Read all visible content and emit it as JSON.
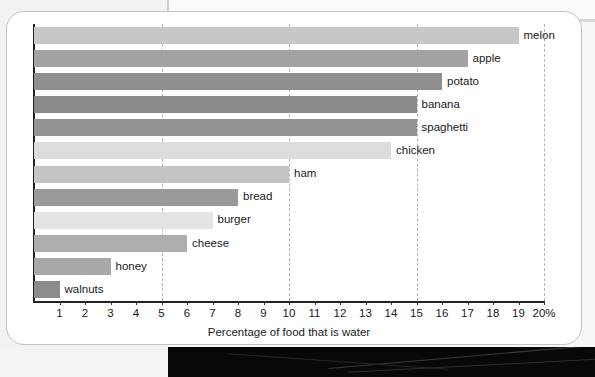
{
  "chart_data": {
    "type": "bar",
    "orientation": "horizontal",
    "title": "",
    "xlabel": "Percentage of food that is water",
    "ylabel": "",
    "xlim": [
      0,
      20
    ],
    "grid": true,
    "grid_values": [
      5,
      10,
      15,
      20
    ],
    "axis_unit_suffix": "%",
    "legend": "none",
    "tick_labels": [
      "1",
      "2",
      "3",
      "4",
      "5",
      "6",
      "7",
      "8",
      "9",
      "10",
      "11",
      "12",
      "13",
      "14",
      "15",
      "16",
      "17",
      "18",
      "19",
      "20%"
    ],
    "tick_values": [
      1,
      2,
      3,
      4,
      5,
      6,
      7,
      8,
      9,
      10,
      11,
      12,
      13,
      14,
      15,
      16,
      17,
      18,
      19,
      20
    ],
    "categories": [
      "melon",
      "apple",
      "potato",
      "banana",
      "spaghetti",
      "chicken",
      "ham",
      "bread",
      "burger",
      "cheese",
      "honey",
      "walnuts"
    ],
    "values": [
      19,
      17,
      16,
      15,
      15,
      14,
      10,
      8,
      7,
      6,
      3,
      1
    ],
    "bars": [
      {
        "label": "melon",
        "value": 19,
        "color": "#c7c7c7"
      },
      {
        "label": "apple",
        "value": 17,
        "color": "#a3a3a3"
      },
      {
        "label": "potato",
        "value": 16,
        "color": "#8f8f8f"
      },
      {
        "label": "banana",
        "value": 15,
        "color": "#8a8a8a"
      },
      {
        "label": "spaghetti",
        "value": 15,
        "color": "#949494"
      },
      {
        "label": "chicken",
        "value": 14,
        "color": "#dcdcdc"
      },
      {
        "label": "ham",
        "value": 10,
        "color": "#c4c4c4"
      },
      {
        "label": "bread",
        "value": 8,
        "color": "#9a9a9a"
      },
      {
        "label": "burger",
        "value": 7,
        "color": "#e4e4e4"
      },
      {
        "label": "cheese",
        "value": 6,
        "color": "#aeaeae"
      },
      {
        "label": "honey",
        "value": 3,
        "color": "#a8a8a8"
      },
      {
        "label": "walnuts",
        "value": 1,
        "color": "#8c8c8c"
      }
    ],
    "colors": {
      "axis": "#222222",
      "gridline": "#b4b4b4",
      "text": "#1a1a1a",
      "card_background": "#ffffff",
      "card_border": "#c2c2c2",
      "page_background": "#f7f7f7"
    }
  }
}
